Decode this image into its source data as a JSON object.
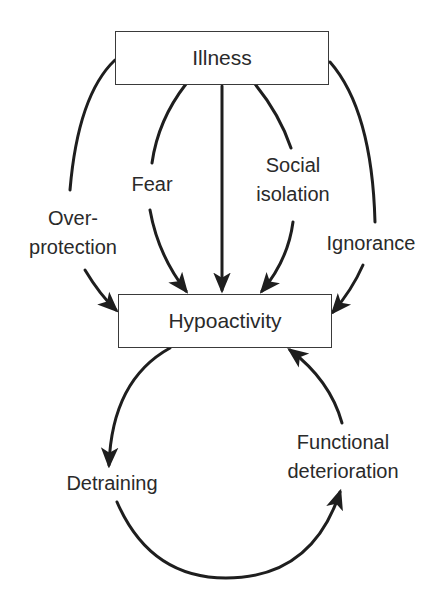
{
  "nodes": {
    "illness": "Illness",
    "hypoactivity": "Hypoactivity"
  },
  "causes": {
    "over_protection_line1": "Over-",
    "over_protection_line2": "protection",
    "fear": "Fear",
    "social_isolation_line1": "Social",
    "social_isolation_line2": "isolation",
    "ignorance": "Ignorance"
  },
  "cycle": {
    "detraining": "Detraining",
    "functional_deterioration_line1": "Functional",
    "functional_deterioration_line2": "deterioration"
  },
  "colors": {
    "line": "#1e1e1e",
    "text": "#2a2a2a",
    "background": "#ffffff"
  }
}
